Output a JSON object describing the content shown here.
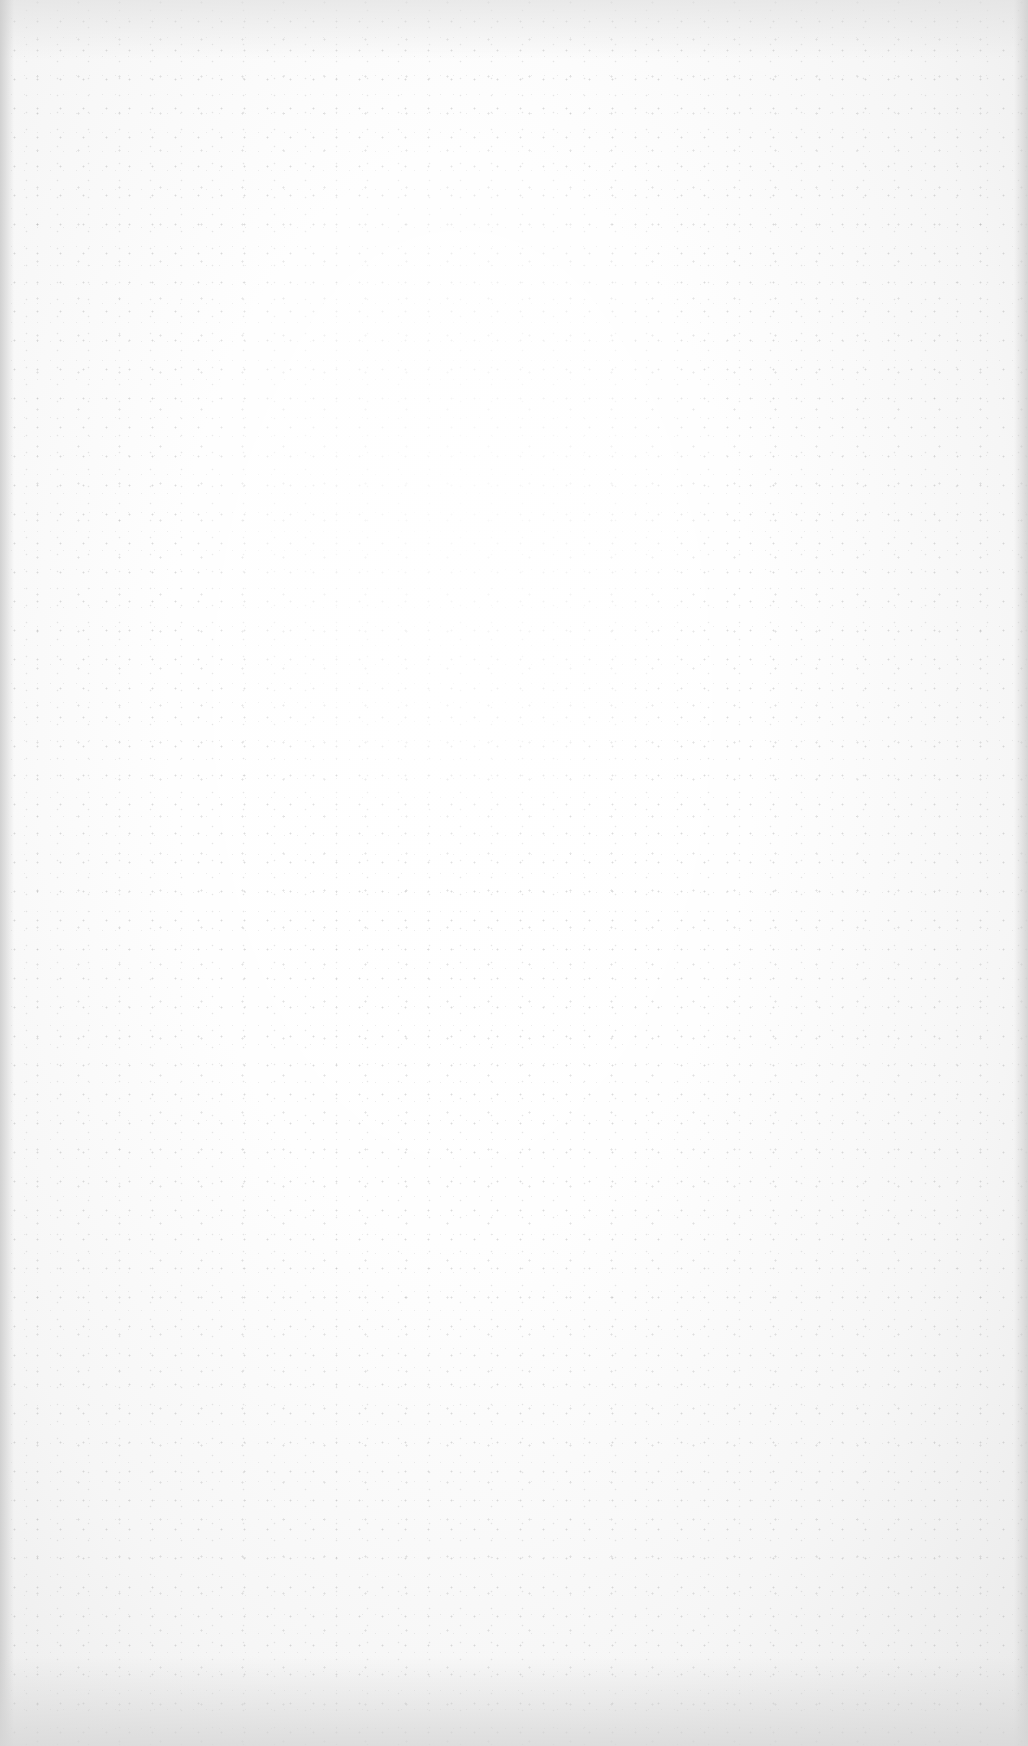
{
  "document": {
    "type": "blank-scanned-page",
    "text_content": [],
    "colors": {
      "paper": "#fbfbfb",
      "edge_shade": "#d6d6d6",
      "speckle": "#9a9a9a"
    }
  }
}
